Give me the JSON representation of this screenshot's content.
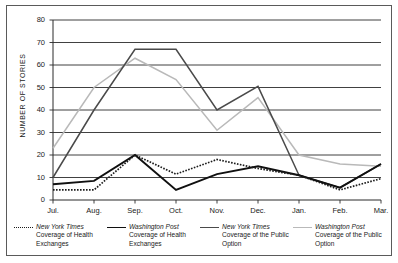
{
  "chart_data": {
    "type": "line",
    "title": "",
    "xlabel": "",
    "ylabel": "NUMBER OF  STORIES",
    "ylim": [
      0,
      80
    ],
    "ytick_step": 10,
    "grid": true,
    "legend_position": "bottom",
    "categories": [
      "Jul.",
      "Aug.",
      "Sep.",
      "Oct.",
      "Nov.",
      "Dec.",
      "Jan.",
      "Feb.",
      "Mar."
    ],
    "yticks": [
      "0",
      "10",
      "20",
      "30",
      "40",
      "50",
      "60",
      "70",
      "80"
    ],
    "series": [
      {
        "name": "New York Times Coverage of Health Exchanges",
        "style": "dotted",
        "color": "#1b1b1b",
        "values": [
          4.5,
          4.5,
          20,
          11.5,
          18,
          14,
          11,
          4.5,
          9.5
        ]
      },
      {
        "name": "Washington Post Coverage of Health Exchanges",
        "style": "solid",
        "color": "#101010",
        "values": [
          7,
          8.5,
          20,
          4.5,
          11.5,
          15,
          11,
          5.5,
          16
        ]
      },
      {
        "name": "New York Times Coverage of the Public Option",
        "style": "solid",
        "color": "#4a4a4a",
        "values": [
          10,
          40,
          67,
          67,
          40,
          50.5,
          11,
          5.5,
          16
        ]
      },
      {
        "name": "Washington Post Coverage of the Public Option",
        "style": "solid",
        "color": "#b9b9b9",
        "values": [
          23,
          50,
          63,
          53.5,
          31,
          45.5,
          20,
          16,
          15
        ]
      }
    ]
  },
  "legend": {
    "items": [
      {
        "title": "New York Times",
        "subtitle": "Coverage of Health Exchanges",
        "swatch": "dotted-line-swatch"
      },
      {
        "title": "Washington Post",
        "subtitle": "Coverage of Health Exchanges",
        "swatch": "black-line-swatch"
      },
      {
        "title": "New York Times",
        "subtitle": "Coverage of the Public Option",
        "swatch": "dark-gray-line-swatch"
      },
      {
        "title": "Washington Post",
        "subtitle": "Coverage of the Public Option",
        "swatch": "light-gray-line-swatch"
      }
    ]
  },
  "colors": {
    "frame": "#5a5a5a",
    "gridline": "#2b2b2b",
    "background": "#ffffff"
  }
}
